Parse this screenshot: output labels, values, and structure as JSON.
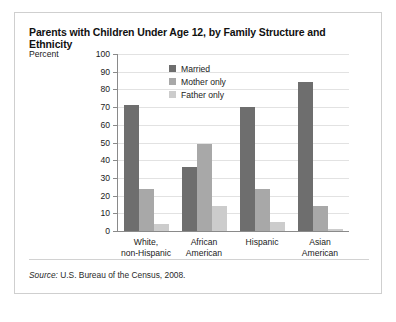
{
  "chart_data": {
    "type": "bar",
    "title": "Parents with Children Under Age 12, by Family Structure and Ethnicity",
    "xlabel": "",
    "ylabel": "Percent",
    "ylim": [
      0,
      100
    ],
    "ytick_step": 10,
    "yticks": [
      100,
      90,
      80,
      70,
      60,
      50,
      40,
      30,
      20,
      10,
      0
    ],
    "grid": true,
    "legend_position": "top-left-inside",
    "categories": [
      "White,\nnon-Hispanic",
      "African\nAmerican",
      "Hispanic",
      "Asian\nAmerican"
    ],
    "category_lines": [
      [
        "White,",
        "non-Hispanic"
      ],
      [
        "African",
        "American"
      ],
      [
        "Hispanic",
        ""
      ],
      [
        "Asian",
        "American"
      ]
    ],
    "series": [
      {
        "name": "Married",
        "color": "#6e6e6e",
        "values": [
          71,
          36,
          70,
          84
        ]
      },
      {
        "name": "Mother only",
        "color": "#a8a8a8",
        "values": [
          24,
          49,
          24,
          14
        ]
      },
      {
        "name": "Father only",
        "color": "#cccccc",
        "values": [
          4,
          14,
          5,
          1
        ]
      }
    ]
  },
  "source": {
    "prefix": "Source:",
    "text": " U.S. Bureau of the Census, 2008."
  }
}
